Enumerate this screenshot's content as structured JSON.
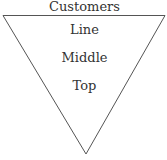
{
  "diagram": {
    "type": "inverted-pyramid",
    "title": "Customers",
    "levels": [
      {
        "label": "Line"
      },
      {
        "label": "Middle"
      },
      {
        "label": "Top"
      }
    ],
    "colors": {
      "stroke": "#555555",
      "text": "#333333",
      "background": "#ffffff"
    }
  }
}
